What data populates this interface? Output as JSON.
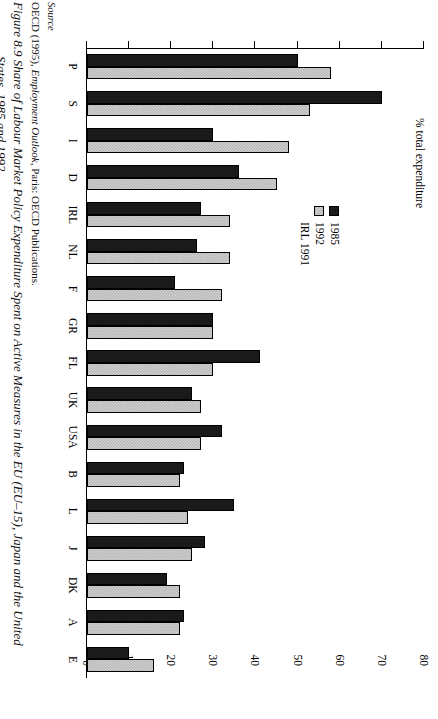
{
  "figure": {
    "source_label": "Source",
    "source_text_pre": "OECD (1995), ",
    "source_text_italic": "Employment Outlook",
    "source_text_post": ", Paris: OECD Publications.",
    "title_line1": "Figure 8.9  Share of Labour Market Policy Expenditure Spent on Active Measures in the EU (EU–15), Japan and the United",
    "title_line2": "States, 1985 and 1992"
  },
  "legend": {
    "position": "top-left",
    "items": [
      {
        "label": "1985",
        "swatch": "black-square-icon",
        "color": "#1a1a1a"
      },
      {
        "label": "1992",
        "swatch": "grey-hatched-square-icon",
        "color": "#c4c4c4"
      },
      {
        "label": "IRL 1991",
        "swatch": "none",
        "color": ""
      }
    ]
  },
  "chart_data": {
    "type": "bar",
    "title": "Share of Labour Market Policy Expenditure Spent on Active Measures in the EU (EU–15), Japan and the United States, 1985 and 1992",
    "xlabel": "",
    "ylabel": "% total expenditure",
    "ylim": [
      0,
      80
    ],
    "yticks": [
      0,
      10,
      20,
      30,
      40,
      50,
      60,
      70,
      80
    ],
    "grid": false,
    "orientation": "vertical",
    "categories": [
      "P",
      "S",
      "I",
      "D",
      "IRL",
      "NL",
      "F",
      "GR",
      "FL",
      "UK",
      "USA",
      "B",
      "L",
      "J",
      "DK",
      "A",
      "E"
    ],
    "series": [
      {
        "name": "1985",
        "color": "#1a1a1a",
        "values": [
          50,
          70,
          30,
          36,
          27,
          26,
          21,
          30,
          41,
          25,
          32,
          23,
          35,
          28,
          19,
          23,
          10
        ]
      },
      {
        "name": "1992",
        "color": "#c4c4c4",
        "values": [
          58,
          53,
          48,
          45,
          34,
          34,
          32,
          30,
          30,
          27,
          27,
          22,
          24,
          25,
          22,
          22,
          16
        ]
      }
    ]
  }
}
